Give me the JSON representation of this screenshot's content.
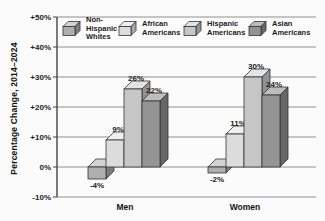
{
  "chart_data": {
    "type": "bar",
    "title": "",
    "xlabel": "",
    "ylabel": "Percentage Change, 2014–2024",
    "ylim": [
      -10,
      50
    ],
    "grid": true,
    "legend_position": "top",
    "yticks": [
      {
        "value": 50,
        "label": "+50%"
      },
      {
        "value": 40,
        "label": "+40%"
      },
      {
        "value": 30,
        "label": "+30%"
      },
      {
        "value": 20,
        "label": "+20%"
      },
      {
        "value": 10,
        "label": "+10%"
      },
      {
        "value": 0,
        "label": "0%"
      },
      {
        "value": -10,
        "label": "-10%"
      }
    ],
    "categories": [
      "Men",
      "Women"
    ],
    "series": [
      {
        "name": "Non-Hispanic Whites",
        "legend_lines": [
          "Non-",
          "Hispanic",
          "Whites"
        ],
        "values": [
          -4,
          -2
        ],
        "value_labels": [
          "-4%",
          "-2%"
        ],
        "colors": {
          "front": "#aeaeae",
          "top": "#d2d2d2",
          "side": "#7d7d7d"
        }
      },
      {
        "name": "African Americans",
        "legend_lines": [
          "African",
          "Americans"
        ],
        "values": [
          9,
          11
        ],
        "value_labels": [
          "9%",
          "11%"
        ],
        "colors": {
          "front": "#dcdcdc",
          "top": "#efefef",
          "side": "#a9a9a9"
        }
      },
      {
        "name": "Hispanic Americans",
        "legend_lines": [
          "Hispanic",
          "Americans"
        ],
        "values": [
          26,
          30
        ],
        "value_labels": [
          "26%",
          "30%"
        ],
        "colors": {
          "front": "#c6c6c6",
          "top": "#e3e3e3",
          "side": "#929292"
        }
      },
      {
        "name": "Asian Americans",
        "legend_lines": [
          "Asian",
          "Americans"
        ],
        "values": [
          22,
          24
        ],
        "value_labels": [
          "22%",
          "24%"
        ],
        "colors": {
          "front": "#949494",
          "top": "#bdbdbd",
          "side": "#676767"
        }
      }
    ],
    "axis_color": "#444444",
    "grid_color": "#8f8f8f",
    "outline_color": "#333333",
    "text_color": "#1c1c1c",
    "background": "#fbfbfb"
  }
}
